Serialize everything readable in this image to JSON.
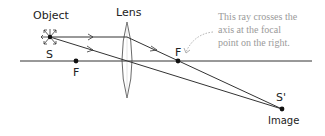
{
  "labels": {
    "object": "Object",
    "source": "S",
    "lens": "Lens",
    "focal_left": "F",
    "focal_right": "F",
    "image_point": "S'",
    "image": "Image"
  },
  "annotation": {
    "line1": "This ray crosses the",
    "line2": "axis at the focal",
    "line3": "point on the right."
  },
  "colors": {
    "line": "#333333",
    "annotation": "#9a9a9a"
  }
}
